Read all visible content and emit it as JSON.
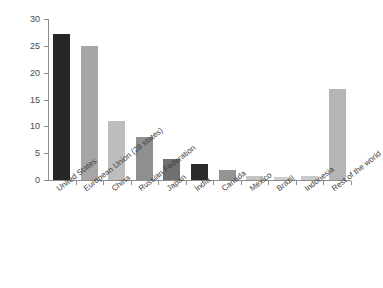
{
  "chart_data": {
    "type": "bar",
    "title": "CO2 emissions",
    "xlabel": "",
    "ylabel": "",
    "categories": [
      "United States",
      "European Union (28 states)",
      "China",
      "Russian Federation",
      "Japan",
      "India",
      "Canada",
      "Mexico",
      "Brazil",
      "Indonesia",
      "Rest of the world"
    ],
    "values": [
      27.3,
      25.0,
      11.0,
      8.0,
      4.0,
      3.0,
      1.8,
      0.8,
      0.6,
      0.7,
      17.0
    ],
    "bar_colors": [
      "#262626",
      "#a6a6a6",
      "#bdbdbd",
      "#8f8f8f",
      "#707070",
      "#2b2b2b",
      "#949494",
      "#c4c4c4",
      "#cdcdcd",
      "#c9c9c9",
      "#b5b5b5"
    ],
    "ylim": [
      0,
      30
    ],
    "yticks": [
      0,
      5,
      10,
      15,
      20,
      25,
      30
    ],
    "ytick_labels": [
      "0",
      "5",
      "10",
      "15",
      "20",
      "25",
      "30"
    ],
    "grid": false,
    "legend": false,
    "legend_position": "none"
  },
  "axis": {
    "line_color": "#8c8c8c"
  }
}
